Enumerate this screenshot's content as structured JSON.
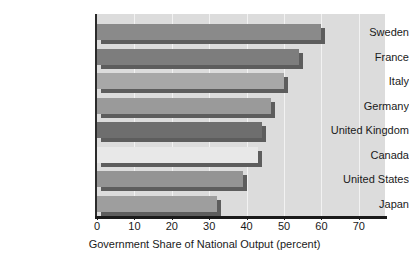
{
  "chart_data": {
    "type": "bar",
    "orientation": "horizontal",
    "title": "",
    "xlabel": "Government Share of National Output (percent)",
    "ylabel": "",
    "categories": [
      "Sweden",
      "France",
      "Italy",
      "Germany",
      "United Kingdom",
      "Canada",
      "United States",
      "Japan"
    ],
    "values": [
      60,
      54,
      50,
      46.5,
      44,
      43,
      39,
      32
    ],
    "xlim": [
      0,
      77
    ],
    "xticks": [
      0,
      10,
      20,
      30,
      40,
      50,
      60,
      70
    ],
    "xtick_labels": [
      "0",
      "10",
      "20",
      "30",
      "40",
      "50",
      "60",
      "70"
    ],
    "grid": true,
    "grid_axis": "x",
    "legend": "none",
    "bar_colors": [
      "#8a8a8a",
      "#7d7d7d",
      "#a8a8a8",
      "#9a9a9a",
      "#6e6e6e",
      "#e8e8e8",
      "#949494",
      "#9e9e9e"
    ],
    "series": [
      {
        "name": "Government Share of National Output",
        "points": [
          {
            "category": "Sweden",
            "value": 60
          },
          {
            "category": "France",
            "value": 54
          },
          {
            "category": "Italy",
            "value": 50
          },
          {
            "category": "Germany",
            "value": 46.5
          },
          {
            "category": "United Kingdom",
            "value": 44
          },
          {
            "category": "Canada",
            "value": 43
          },
          {
            "category": "United States",
            "value": 39
          },
          {
            "category": "Japan",
            "value": 32
          }
        ]
      }
    ]
  },
  "style": {
    "plot_background": "#dcdcdc",
    "gridline_color": "#f2f2f2",
    "axis_color": "#1a1a1a",
    "shadow_color": "#5d5d5d",
    "page_background": "#ffffff"
  }
}
